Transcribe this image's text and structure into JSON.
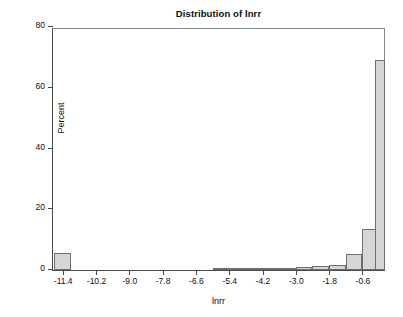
{
  "chart_data": {
    "type": "bar",
    "title": "Distribution of lnrr",
    "xlabel": "lnrr",
    "ylabel": "Percent",
    "xlim": [
      -11.75,
      0.25
    ],
    "ylim": [
      0,
      80
    ],
    "grid": false,
    "legend": null,
    "bin_width": 0.6,
    "x_ticks": [
      "-11.4",
      "-10.2",
      "-9.0",
      "-7.8",
      "-6.6",
      "-5.4",
      "-4.2",
      "-3.0",
      "-1.8",
      "-0.6"
    ],
    "x_tick_values": [
      -11.4,
      -10.2,
      -9.0,
      -7.8,
      -6.6,
      -5.4,
      -4.2,
      -3.0,
      -1.8,
      -0.6
    ],
    "y_ticks": [
      "0",
      "20",
      "40",
      "60",
      "80"
    ],
    "y_tick_values": [
      0,
      20,
      40,
      60,
      80
    ],
    "bin_centers": [
      -11.4,
      -5.7,
      -5.1,
      -4.5,
      -3.9,
      -3.3,
      -2.7,
      -2.1,
      -1.5,
      -0.9,
      -0.3
    ],
    "values": [
      5.6,
      0.3,
      0.6,
      0.4,
      0.5,
      0.7,
      0.9,
      1.4,
      1.7,
      5.2,
      13.4,
      69.3
    ],
    "bars": [
      {
        "center": -11.4,
        "left": -11.7,
        "right": -11.1,
        "value": 5.6
      },
      {
        "center": -5.7,
        "left": -6.0,
        "right": -5.4,
        "value": 0.3
      },
      {
        "center": -5.1,
        "left": -5.4,
        "right": -4.8,
        "value": 0.6
      },
      {
        "center": -4.5,
        "left": -4.8,
        "right": -4.2,
        "value": 0.4
      },
      {
        "center": -3.9,
        "left": -4.2,
        "right": -3.6,
        "value": 0.5
      },
      {
        "center": -3.3,
        "left": -3.6,
        "right": -3.0,
        "value": 0.7
      },
      {
        "center": -2.7,
        "left": -3.0,
        "right": -2.4,
        "value": 0.9
      },
      {
        "center": -2.1,
        "left": -2.4,
        "right": -1.8,
        "value": 1.4
      },
      {
        "center": -1.5,
        "left": -1.8,
        "right": -1.2,
        "value": 1.7
      },
      {
        "center": -0.9,
        "left": -1.2,
        "right": -0.6,
        "value": 5.2
      },
      {
        "center": -0.3,
        "left": -0.6,
        "right": 0.0,
        "value": 13.4
      },
      {
        "center": 0.0,
        "left": -0.15,
        "right": 0.2,
        "value": 69.3
      }
    ],
    "colors": {
      "bar_fill": "#d6d6d6",
      "bar_border": "#6e6e6e",
      "axis": "#4a4a4a",
      "text": "#0d0d0d",
      "background": "#ffffff"
    }
  },
  "artifact": {
    "caption_fragment": ""
  }
}
